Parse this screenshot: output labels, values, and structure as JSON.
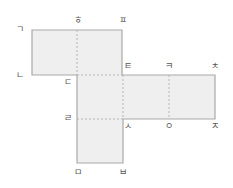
{
  "diagram": {
    "colors": {
      "fill": "#efefef",
      "stroke": "#a9a9a9",
      "fold": "#b5b5b5",
      "label": "#555555"
    },
    "faces": [
      {
        "id": "top-left",
        "x": 32,
        "y": 30,
        "w": 45,
        "h": 45
      },
      {
        "id": "top-right",
        "x": 77,
        "y": 30,
        "w": 45,
        "h": 45
      },
      {
        "id": "center",
        "x": 77,
        "y": 75,
        "w": 46,
        "h": 44
      },
      {
        "id": "right-1",
        "x": 123,
        "y": 75,
        "w": 46,
        "h": 44
      },
      {
        "id": "right-2",
        "x": 169,
        "y": 75,
        "w": 46,
        "h": 44
      },
      {
        "id": "bottom",
        "x": 77,
        "y": 119,
        "w": 46,
        "h": 44
      }
    ],
    "labels": [
      {
        "text": "ㄱ",
        "x": 20,
        "y": 29
      },
      {
        "text": "ㅎ",
        "x": 78,
        "y": 20
      },
      {
        "text": "ㅍ",
        "x": 123,
        "y": 20
      },
      {
        "text": "ㄴ",
        "x": 20,
        "y": 75
      },
      {
        "text": "ㄷ",
        "x": 68,
        "y": 82
      },
      {
        "text": "ㅌ",
        "x": 128,
        "y": 66
      },
      {
        "text": "ㅋ",
        "x": 169,
        "y": 66
      },
      {
        "text": "ㅊ",
        "x": 215,
        "y": 66
      },
      {
        "text": "ㄹ",
        "x": 68,
        "y": 118
      },
      {
        "text": "ㅅ",
        "x": 128,
        "y": 126
      },
      {
        "text": "ㅇ",
        "x": 169,
        "y": 126
      },
      {
        "text": "ㅈ",
        "x": 215,
        "y": 126
      },
      {
        "text": "ㅁ",
        "x": 78,
        "y": 172
      },
      {
        "text": "ㅂ",
        "x": 123,
        "y": 172
      }
    ]
  }
}
